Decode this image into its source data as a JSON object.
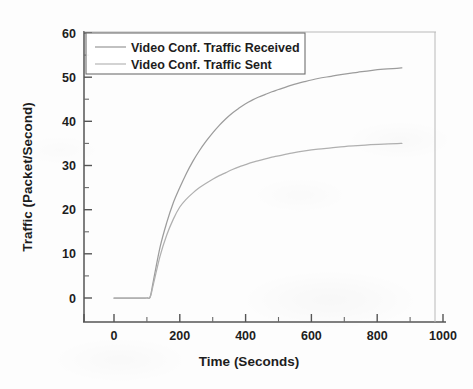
{
  "chart_data": {
    "type": "line",
    "title": "",
    "xlabel": "Time (Seconds)",
    "ylabel": "Traffic (Packet/Second)",
    "xlim": [
      -100,
      1000
    ],
    "ylim": [
      0,
      60
    ],
    "xticks": [
      0,
      200,
      400,
      600,
      800,
      1000
    ],
    "xtick_labels": [
      "0",
      "200",
      "400",
      "600",
      "800",
      "1000"
    ],
    "xminor_interval": 100,
    "yticks": [
      0,
      10,
      20,
      30,
      40,
      50,
      60
    ],
    "ytick_labels": [
      "0",
      "10",
      "20",
      "30",
      "40",
      "50",
      "60"
    ],
    "yminor_interval": 5,
    "grid": false,
    "legend_position": "upper left",
    "line_color": "#9a9a9a",
    "axis_color": "#4a4a4a",
    "series": [
      {
        "name": "Video Conf. Traffic Received",
        "x": [
          0,
          20,
          40,
          60,
          80,
          100,
          110,
          120,
          140,
          160,
          180,
          200,
          220,
          240,
          260,
          280,
          300,
          320,
          340,
          360,
          380,
          400,
          420,
          440,
          460,
          480,
          500,
          540,
          580,
          620,
          660,
          700,
          740,
          780,
          820,
          860,
          875
        ],
        "values": [
          0,
          0,
          0,
          0,
          0,
          0,
          0.3,
          4.0,
          11.5,
          17.0,
          21.5,
          25.0,
          28.2,
          31.0,
          33.4,
          35.5,
          37.4,
          39.1,
          40.6,
          41.9,
          43.0,
          44.0,
          44.8,
          45.5,
          46.1,
          46.7,
          47.2,
          48.2,
          49.0,
          49.7,
          50.2,
          50.7,
          51.1,
          51.5,
          51.8,
          52.0,
          52.1
        ]
      },
      {
        "name": "Video Conf. Traffic Sent",
        "x": [
          0,
          20,
          40,
          60,
          80,
          100,
          110,
          120,
          140,
          160,
          180,
          200,
          220,
          240,
          260,
          280,
          300,
          320,
          340,
          360,
          380,
          400,
          420,
          440,
          460,
          480,
          500,
          540,
          580,
          620,
          660,
          700,
          740,
          780,
          820,
          860,
          875
        ],
        "values": [
          0,
          0,
          0,
          0,
          0,
          0,
          0.2,
          3.2,
          9.5,
          14.2,
          17.8,
          20.6,
          22.4,
          23.8,
          25.0,
          26.0,
          26.9,
          27.7,
          28.4,
          29.1,
          29.7,
          30.2,
          30.7,
          31.1,
          31.5,
          31.9,
          32.2,
          32.8,
          33.3,
          33.7,
          34.0,
          34.3,
          34.5,
          34.7,
          34.85,
          34.95,
          35.0
        ]
      }
    ]
  },
  "axes": {
    "x_title": "Time (Seconds)",
    "y_title": "Traffic (Packet/Second)",
    "x_tick_0": "0",
    "x_tick_200": "200",
    "x_tick_400": "400",
    "x_tick_600": "600",
    "x_tick_800": "800",
    "x_tick_1000": "1000",
    "y_tick_0": "0",
    "y_tick_10": "10",
    "y_tick_20": "20",
    "y_tick_30": "30",
    "y_tick_40": "40",
    "y_tick_50": "50",
    "y_tick_60": "60"
  },
  "legend": {
    "entries": [
      {
        "label": "Video Conf. Traffic Received"
      },
      {
        "label": "Video Conf. Traffic Sent"
      }
    ]
  }
}
